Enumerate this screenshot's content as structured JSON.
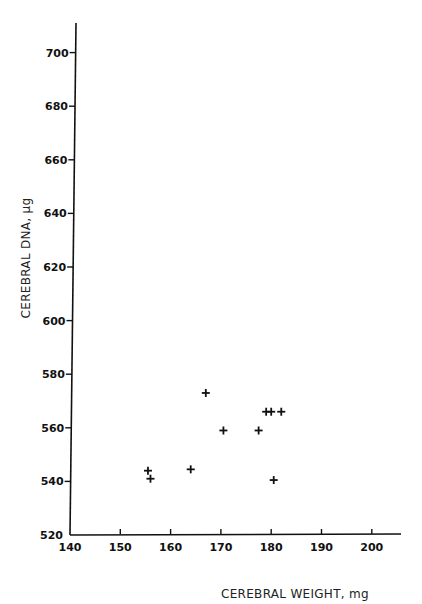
{
  "chart_data": {
    "type": "scatter",
    "title": "",
    "xlabel": "CEREBRAL WEIGHT, mg",
    "ylabel": "CEREBRAL DNA, μg",
    "xlim": [
      140,
      205
    ],
    "ylim": [
      520,
      712
    ],
    "x_ticks": [
      140,
      150,
      160,
      170,
      180,
      190,
      200
    ],
    "y_ticks": [
      520,
      540,
      560,
      580,
      600,
      620,
      640,
      660,
      680,
      700
    ],
    "grid": false,
    "legend": null,
    "marker": "+",
    "series": [
      {
        "name": "data",
        "points": [
          {
            "x": 155.5,
            "y": 544
          },
          {
            "x": 156,
            "y": 541
          },
          {
            "x": 164,
            "y": 544.5
          },
          {
            "x": 167,
            "y": 573
          },
          {
            "x": 170.5,
            "y": 559
          },
          {
            "x": 177.5,
            "y": 559
          },
          {
            "x": 179,
            "y": 566
          },
          {
            "x": 180,
            "y": 566
          },
          {
            "x": 182,
            "y": 566
          },
          {
            "x": 180.5,
            "y": 540.5
          }
        ]
      }
    ]
  }
}
